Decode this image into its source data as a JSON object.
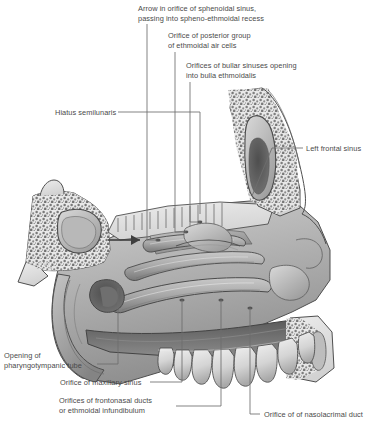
{
  "figure": {
    "type": "anatomical-illustration",
    "style": "grayscale halftone line drawing",
    "colors": {
      "background": "#ffffff",
      "leader_line": "#6e6e6e",
      "label_text": "#4a4a4a",
      "bone_fill": "#e4e4e4",
      "bone_stipple": "#6a6a6a",
      "mucosa_light": "#c8c8c8",
      "mucosa_mid": "#a6a6a6",
      "mucosa_dark": "#7d7d7d",
      "cavity_dark": "#5c5c5c",
      "tooth_fill": "#dcdcdc",
      "outline": "#4a4a4a"
    }
  },
  "labels": [
    {
      "id": "sphenoidal-sinus-arrow",
      "lines": [
        "Arrow in orifice of sphenoidal sinus,",
        "passing into spheno-ethmoidal recess"
      ],
      "x": 138,
      "y": 4,
      "align": "left"
    },
    {
      "id": "posterior-ethmoidal-air-cells",
      "lines": [
        "Orifice of posterior group",
        "of ethmoidal air cells"
      ],
      "x": 168,
      "y": 31,
      "align": "left"
    },
    {
      "id": "bullar-sinuses",
      "lines": [
        "Orifices of bullar sinuses opening",
        "into bulla ethmoidalis"
      ],
      "x": 186,
      "y": 61,
      "align": "left"
    },
    {
      "id": "hiatus-semilunaris",
      "lines": [
        "Hiatus semilunaris"
      ],
      "x": 55,
      "y": 108,
      "align": "left"
    },
    {
      "id": "left-frontal-sinus",
      "lines": [
        "Left frontal sinus"
      ],
      "x": 306,
      "y": 144,
      "align": "left"
    },
    {
      "id": "pharyngotympanic-tube",
      "lines": [
        "Opening of",
        "pharyngotympanic tube"
      ],
      "x": 4,
      "y": 351,
      "align": "left"
    },
    {
      "id": "maxillary-sinus",
      "lines": [
        "Orifice of maxillary sinus"
      ],
      "x": 60,
      "y": 378,
      "align": "left"
    },
    {
      "id": "frontonasal-ducts",
      "lines": [
        "Orifices of frontonasal ducts",
        "or ethmoidal infundibulum"
      ],
      "x": 59,
      "y": 396,
      "align": "left"
    },
    {
      "id": "nasolacrimal-duct",
      "lines": [
        "Orifice of of nasolacrimal duct"
      ],
      "x": 264,
      "y": 410,
      "align": "left"
    }
  ],
  "leaders": [
    {
      "id": "leader-sphenoidal-sinus",
      "points": "147,24 147,240 157,240"
    },
    {
      "id": "leader-posterior-ethmoidal",
      "points": "175,52 175,232 186,232"
    },
    {
      "id": "leader-bullar-sinuses",
      "points": "190,82 190,222 200,222"
    },
    {
      "id": "leader-hiatus-semilunaris",
      "points": "118,112 200,112 200,214"
    },
    {
      "id": "leader-left-frontal-sinus",
      "points": "303,148 272,148 252,196"
    },
    {
      "id": "leader-pharyngotympanic",
      "points": "97,364 118,364 118,288"
    },
    {
      "id": "leader-maxillary-sinus",
      "points": "150,382 182,382 182,300"
    },
    {
      "id": "leader-frontonasal-ducts",
      "points": "176,406 221,406 221,300"
    },
    {
      "id": "leader-nasolacrimal-duct",
      "points": "260,414 250,414 250,308"
    }
  ]
}
